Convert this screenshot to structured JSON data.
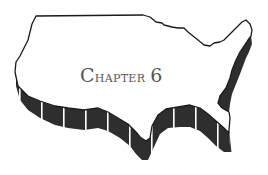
{
  "heading": {
    "label_first": "C",
    "label_rest": "hapter",
    "number": "6"
  },
  "illustration": {
    "subject": "us-map-outline-extruded",
    "outline_color": "#1a1a1a",
    "extrusion_color": "#2e2e2e",
    "stripe_color": "#ffffff",
    "text_color": "#555555"
  }
}
